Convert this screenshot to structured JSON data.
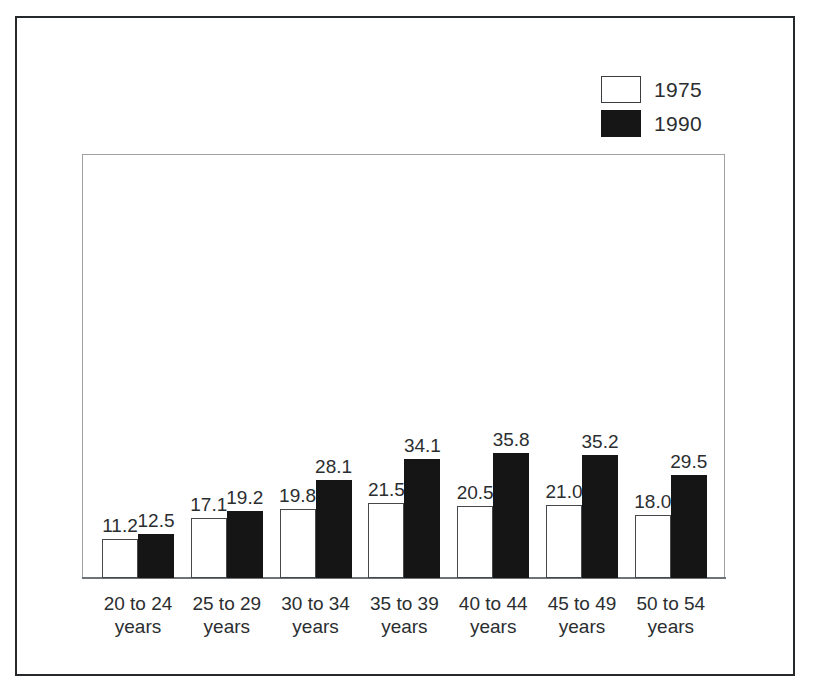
{
  "chart_data": {
    "type": "bar",
    "title": "",
    "subtitle": "",
    "xlabel": "",
    "ylabel": "",
    "ylim": [
      0,
      42
    ],
    "grid": false,
    "legend_position": "top-right",
    "categories": [
      "20 to 24 years",
      "25 to 29 years",
      "30 to 34 years",
      "35 to 39 years",
      "40 to 44 years",
      "45 to 49 years",
      "50 to 54 years"
    ],
    "category_lines": [
      [
        "20 to 24",
        "years"
      ],
      [
        "25 to 29",
        "years"
      ],
      [
        "30 to 34",
        "years"
      ],
      [
        "35 to 39",
        "years"
      ],
      [
        "40 to 44",
        "years"
      ],
      [
        "45 to 49",
        "years"
      ],
      [
        "50 to 54",
        "years"
      ]
    ],
    "series": [
      {
        "name": "1975",
        "color": "#ffffff",
        "values": [
          11.2,
          17.1,
          19.8,
          21.5,
          20.5,
          21.0,
          18.0
        ],
        "labels": [
          "11.2",
          "17.1",
          "19.8",
          "21.5",
          "20.5",
          "21.0",
          "18.0"
        ]
      },
      {
        "name": "1990",
        "color": "#151515",
        "values": [
          12.5,
          19.2,
          28.1,
          34.1,
          35.8,
          35.2,
          29.5
        ],
        "labels": [
          "12.5",
          "19.2",
          "28.1",
          "34.1",
          "35.8",
          "35.2",
          "29.5"
        ]
      }
    ]
  },
  "legend": {
    "entries": [
      {
        "label": "1975",
        "swatch": "open-square-swatch"
      },
      {
        "label": "1990",
        "swatch": "filled-square-swatch"
      }
    ]
  },
  "colors": {
    "frame": "#26292b",
    "plot_border": "#9ea1a3",
    "axis": "#6f7375",
    "text": "#2b2e30",
    "series_1975_fill": "#ffffff",
    "series_1975_stroke": "#45484a",
    "series_1990_fill": "#151515",
    "background": "#ffffff"
  },
  "geometry": {
    "baseline_y": 578,
    "px_per_unit": 3.5,
    "bar_width": 36,
    "group_pitch": 88.8,
    "first_group_left": 102
  }
}
